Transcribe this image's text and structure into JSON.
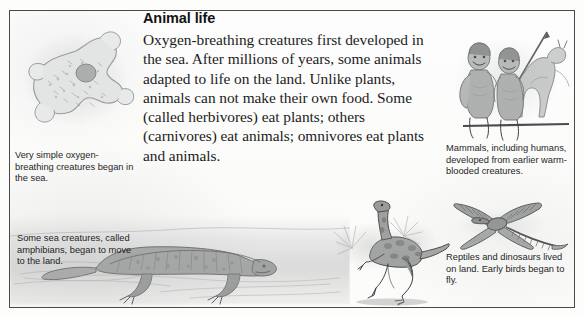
{
  "page": {
    "heading": "Animal life",
    "body": "Oxygen-breathing creatures first developed in the sea. After millions of years, some animals adapted to life on the land. Unlike plants, animals can not make their own food. Some (called herbivores) eat plants; others (carnivores) eat animals; omnivores eat plants and animals."
  },
  "captions": {
    "amoeba": "Very simple oxygen-breathing creatures began in the sea.",
    "mammals": "Mammals, including humans, developed from earlier warm-blooded creatures.",
    "amphibians": "Some sea creatures, called amphibians, began to move to the land.",
    "reptiles": "Reptiles and dinosaurs lived on land. Early birds began to fly."
  },
  "illustrations": {
    "amoeba": "single-celled-amoeba-illustration",
    "cavemen": "early-humans-with-spears-and-horse-illustration",
    "amphibian": "amphibian-emerging-from-water-illustration",
    "dinosaur": "bipedal-dinosaur-illustration",
    "bird": "early-bird-archaeopteryx-in-flight-illustration"
  },
  "colors": {
    "ink": "#1c1c1c",
    "frame": "#4a4a48",
    "paper": "#ffffff",
    "illustration_gray": "#9fa2a0"
  }
}
